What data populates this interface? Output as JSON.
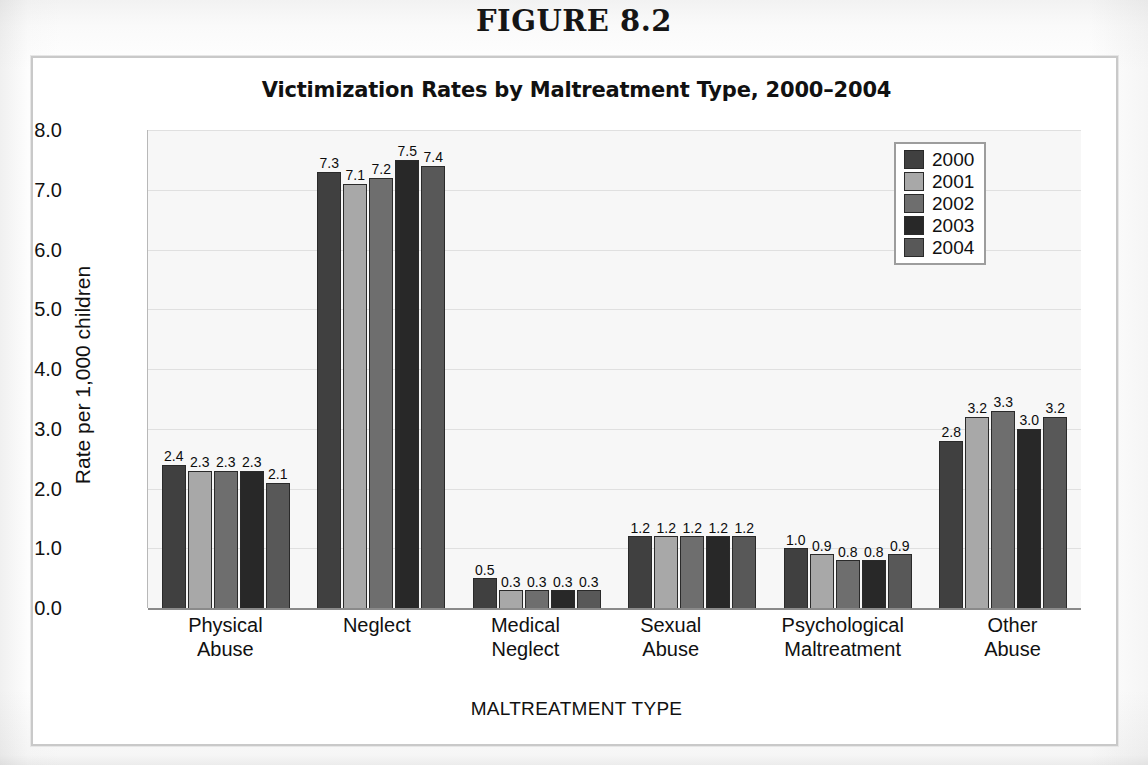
{
  "figure": {
    "number_label": "FIGURE 8.2"
  },
  "chart_data": {
    "type": "bar",
    "title": "Victimization Rates by Maltreatment Type, 2000–2004",
    "xlabel": "MALTREATMENT TYPE",
    "ylabel": "Rate per 1,000 children",
    "ylim": [
      0,
      8
    ],
    "ytick_labels": [
      "8.0",
      "7.0",
      "6.0",
      "5.0",
      "4.0",
      "3.0",
      "2.0",
      "1.0",
      "0.0"
    ],
    "ytick_values": [
      8,
      7,
      6,
      5,
      4,
      3,
      2,
      1,
      0
    ],
    "grid": true,
    "legend_position": "top-right",
    "categories": [
      "Physical\nAbuse",
      "Neglect",
      "Medical\nNeglect",
      "Sexual\nAbuse",
      "Psychological\nMaltreatment",
      "Other\nAbuse"
    ],
    "series": [
      {
        "name": "2000",
        "color": "#404040",
        "values": [
          2.4,
          7.3,
          0.5,
          1.2,
          1.0,
          2.8
        ],
        "labels": [
          "2.4",
          "7.3",
          "0.5",
          "1.2",
          "1.0",
          "2.8"
        ]
      },
      {
        "name": "2001",
        "color": "#a8a8a8",
        "values": [
          2.3,
          7.1,
          0.3,
          1.2,
          0.9,
          3.2
        ],
        "labels": [
          "2.3",
          "7.1",
          "0.3",
          "1.2",
          "0.9",
          "3.2"
        ]
      },
      {
        "name": "2002",
        "color": "#6e6e6e",
        "values": [
          2.3,
          7.2,
          0.3,
          1.2,
          0.8,
          3.3
        ],
        "labels": [
          "2.3",
          "7.2",
          "0.3",
          "1.2",
          "0.8",
          "3.3"
        ]
      },
      {
        "name": "2003",
        "color": "#282828",
        "values": [
          2.3,
          7.5,
          0.3,
          1.2,
          0.8,
          3.0
        ],
        "labels": [
          "2.3",
          "7.5",
          "0.3",
          "1.2",
          "0.8",
          "3.0"
        ]
      },
      {
        "name": "2004",
        "color": "#585858",
        "values": [
          2.1,
          7.4,
          0.3,
          1.2,
          0.9,
          3.2
        ],
        "labels": [
          "2.1",
          "7.4",
          "0.3",
          "1.2",
          "0.9",
          "3.2"
        ]
      }
    ]
  }
}
